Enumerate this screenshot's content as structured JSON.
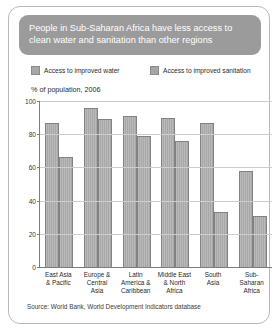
{
  "card": {
    "title": "People in Sub-Saharan Africa have less access to clean water and sanitation than other regions",
    "source": "Source: World Bank, World Development Indicators database",
    "axis_note": "% of population, 2006",
    "header_color": "#9b9b9b",
    "bar_color": "#a8a8a8",
    "border_color": "#b9b9b9"
  },
  "legend": {
    "items": [
      {
        "label": "Access to improved water",
        "color": "#a6a6a6"
      },
      {
        "label": "Access to improved sanitation",
        "color": "#a6a6a6"
      }
    ]
  },
  "chart_data": {
    "type": "bar",
    "title": "People in Sub-Saharan Africa have less access to clean water and sanitation than other regions",
    "subtitle": "% of population, 2006",
    "xlabel": "",
    "ylabel": "% of population, 2006",
    "ylim": [
      0,
      100
    ],
    "yticks": [
      0,
      20,
      40,
      60,
      80,
      100
    ],
    "grid": true,
    "legend_position": "top",
    "categories": [
      "East Asia\n& Pacific",
      "Europe &\nCentral\nAsia",
      "Latin\nAmerica &\nCaribbean",
      "Middle East\n& North\nAfrica",
      "South\nAsia",
      "Sub-\nSaharan\nAfrica"
    ],
    "series": [
      {
        "name": "Access to improved water",
        "values": [
          87,
          96,
          91,
          90,
          87,
          58
        ]
      },
      {
        "name": "Access to improved sanitation",
        "values": [
          66,
          89,
          79,
          76,
          33,
          31
        ]
      }
    ],
    "source": "Source: World Bank, World Development Indicators database"
  }
}
